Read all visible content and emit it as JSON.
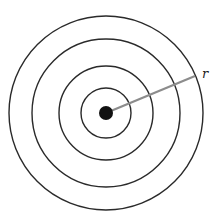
{
  "diagram": {
    "type": "concentric-circles",
    "center": {
      "x": 106,
      "y": 113
    },
    "circles": [
      {
        "r": 97
      },
      {
        "r": 74
      },
      {
        "r": 47
      },
      {
        "r": 25
      }
    ],
    "center_dot": {
      "r": 7,
      "color": "#111111"
    },
    "radius_line": {
      "x2": 195,
      "y2": 76,
      "color": "#8c8c8c"
    },
    "label": {
      "text": "r",
      "x": 202,
      "y": 78
    },
    "stroke_color": "#2a2a2a"
  }
}
